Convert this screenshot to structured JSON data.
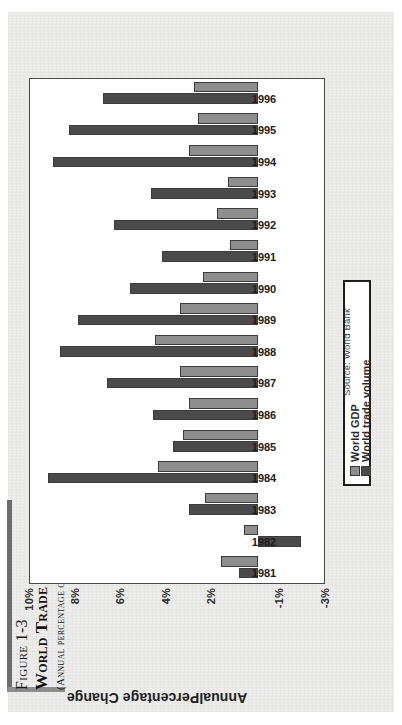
{
  "figure": {
    "number": "Figure 1-3",
    "title": "World Trade Outpaces World Output Growth",
    "subtitle": "(Annual percentage change)",
    "source": "Source: World Bank",
    "axis_title": "AnnualPercentage Change"
  },
  "legend": {
    "position": "top-left-inset",
    "entries": [
      {
        "label": "World GDP",
        "color": "#8e8e8e"
      },
      {
        "label": "World trade volume",
        "color": "#4a4a4a"
      }
    ]
  },
  "colors": {
    "world_gdp": "#8e8e8e",
    "world_trade_volume": "#4a4a4a",
    "plot_border": "#4a4a4a",
    "paper": "#ececea",
    "rule": "#6d6d6d"
  },
  "axis": {
    "tick_labels": [
      "10%",
      "8%",
      "6%",
      "4%",
      "2%",
      "-1%",
      "-3%"
    ],
    "tick_values": [
      10,
      8,
      6,
      4,
      2,
      -1,
      -3
    ]
  },
  "chart_data": {
    "type": "bar",
    "orientation": "horizontal-rotated",
    "title": "World Trade Outpaces World Output Growth",
    "subtitle": "(Annual percentage change)",
    "xlabel": "",
    "ylabel": "AnnualPercentage Change",
    "ylim": [
      -3,
      10
    ],
    "yticks": [
      10,
      8,
      6,
      4,
      2,
      -1,
      -3
    ],
    "ytick_labels": [
      "10%",
      "8%",
      "6%",
      "4%",
      "2%",
      "-1%",
      "-3%"
    ],
    "grid": false,
    "legend": [
      "World GDP",
      "World trade volume"
    ],
    "legend_position": "inside-upper-left",
    "categories": [
      "1981",
      "1982",
      "1983",
      "1984",
      "1985",
      "1986",
      "1987",
      "1988",
      "1989",
      "1990",
      "1991",
      "1992",
      "1993",
      "1994",
      "1995",
      "1996"
    ],
    "series": [
      {
        "name": "World GDP",
        "color": "#8e8e8e",
        "values": [
          1.6,
          0.6,
          2.3,
          4.4,
          3.3,
          3.0,
          3.4,
          4.5,
          3.4,
          2.4,
          1.2,
          1.8,
          1.3,
          3.0,
          2.6,
          2.8
        ]
      },
      {
        "name": "World trade volume",
        "color": "#4a4a4a",
        "values": [
          0.8,
          -1.9,
          3.0,
          9.2,
          3.7,
          4.6,
          6.6,
          8.7,
          7.9,
          5.6,
          4.2,
          6.3,
          4.7,
          9.0,
          8.3,
          6.8
        ]
      }
    ]
  }
}
